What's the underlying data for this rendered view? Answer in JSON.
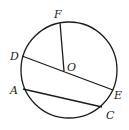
{
  "diagram": {
    "type": "circle-geometry",
    "circle": {
      "center": [
        69,
        70
      ],
      "radius": 48,
      "center_label": "O"
    },
    "points": {
      "F": {
        "label": "F",
        "pos": [
          60,
          23
        ],
        "label_pos": [
          54,
          17
        ]
      },
      "D": {
        "label": "D",
        "pos": [
          22,
          56
        ],
        "label_pos": [
          10,
          59
        ]
      },
      "O": {
        "label": "O",
        "pos": [
          64,
          71
        ],
        "label_pos": [
          68,
          69
        ]
      },
      "E": {
        "label": "E",
        "pos": [
          113,
          90
        ],
        "label_pos": [
          115,
          99
        ]
      },
      "A": {
        "label": "A",
        "pos": [
          23,
          89
        ],
        "label_pos": [
          11,
          93
        ]
      },
      "C": {
        "label": "C",
        "pos": [
          102,
          107
        ],
        "label_pos": [
          107,
          118
        ]
      }
    },
    "segments": [
      {
        "name": "OF",
        "from": "O",
        "to": "F"
      },
      {
        "name": "DE",
        "from": "D",
        "to": "E"
      },
      {
        "name": "AC",
        "from": "A",
        "to": "C"
      }
    ],
    "colors": {
      "stroke": "#1a1a1a",
      "background": "#ffffff"
    }
  }
}
